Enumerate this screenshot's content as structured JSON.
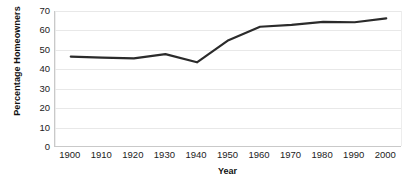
{
  "chart_data": {
    "type": "line",
    "title": "",
    "xlabel": "Year",
    "ylabel": "Percentage Homeowners",
    "x": [
      1900,
      1910,
      1920,
      1930,
      1940,
      1950,
      1960,
      1970,
      1980,
      1990,
      2000
    ],
    "values": [
      46.5,
      46.0,
      45.6,
      47.8,
      43.6,
      55.0,
      61.9,
      62.9,
      64.4,
      64.2,
      66.2
    ],
    "series": [
      {
        "name": "Percentage Homeowners",
        "values": [
          46.5,
          46.0,
          45.6,
          47.8,
          43.6,
          55.0,
          61.9,
          62.9,
          64.4,
          64.2,
          66.2
        ]
      }
    ],
    "x_tick_labels": [
      "1900",
      "1910",
      "1920",
      "1930",
      "1940",
      "1950",
      "1960",
      "1970",
      "1980",
      "1990",
      "2000"
    ],
    "y_tick_labels": [
      "0",
      "10",
      "20",
      "30",
      "40",
      "50",
      "60",
      "70"
    ],
    "y_ticks": [
      0,
      10,
      20,
      30,
      40,
      50,
      60,
      70
    ],
    "xlim": [
      1895,
      2005
    ],
    "ylim": [
      0,
      70
    ],
    "grid": "horizontal",
    "legend": "none",
    "markers": "none",
    "line_color": "#2b2b2b",
    "line_width": 2.2,
    "grid_color": "#e8e8e8",
    "axis_color": "#c9c9c9",
    "background": "#ffffff"
  }
}
